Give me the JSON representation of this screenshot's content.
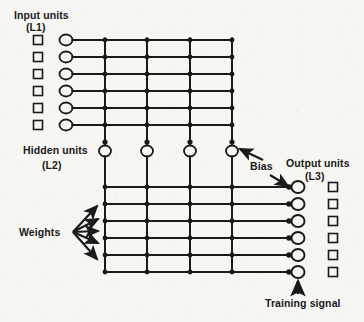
{
  "figure": {
    "type": "neural-network-architecture-diagram",
    "background_color": "#f7f6f3",
    "ink_color": "#1a1a1a"
  },
  "labels": {
    "input_units": "Input units",
    "input_layer_id": "(L1)",
    "hidden_units": "Hidden units",
    "hidden_layer_id": "(L2)",
    "output_units": "Output units",
    "output_layer_id": "(L3)",
    "weights": "Weights",
    "bias": "Bias",
    "training_signal": "Training signal"
  },
  "network": {
    "input_unit_count": 6,
    "hidden_unit_count": 4,
    "output_unit_count": 6,
    "input_square_count": 6,
    "output_square_count": 6,
    "upper_row_count": 6,
    "lower_row_count": 6,
    "column_count": 4,
    "weight_arrow_count": 5,
    "bias_arrow_count": 2
  },
  "geometry": {
    "input_square_x": 38,
    "input_square_y_start": 38,
    "input_square_size": 9,
    "input_circle_x": 66,
    "input_circle_rx": 6.5,
    "input_circle_ry": 5.5,
    "upper_row_y": [
      40,
      57,
      74,
      91,
      108,
      125
    ],
    "column_x": [
      105,
      147,
      190,
      232
    ],
    "hidden_circle_y": 151,
    "hidden_circle_rx": 6,
    "hidden_circle_ry": 5.5,
    "lower_row_y": [
      187,
      204,
      221,
      238,
      255,
      272
    ],
    "output_circle_x": 297,
    "output_circle_rx": 6.5,
    "output_circle_ry": 6,
    "output_square_x": 333,
    "output_square_size": 9,
    "node_dot_radius": 2.3
  }
}
